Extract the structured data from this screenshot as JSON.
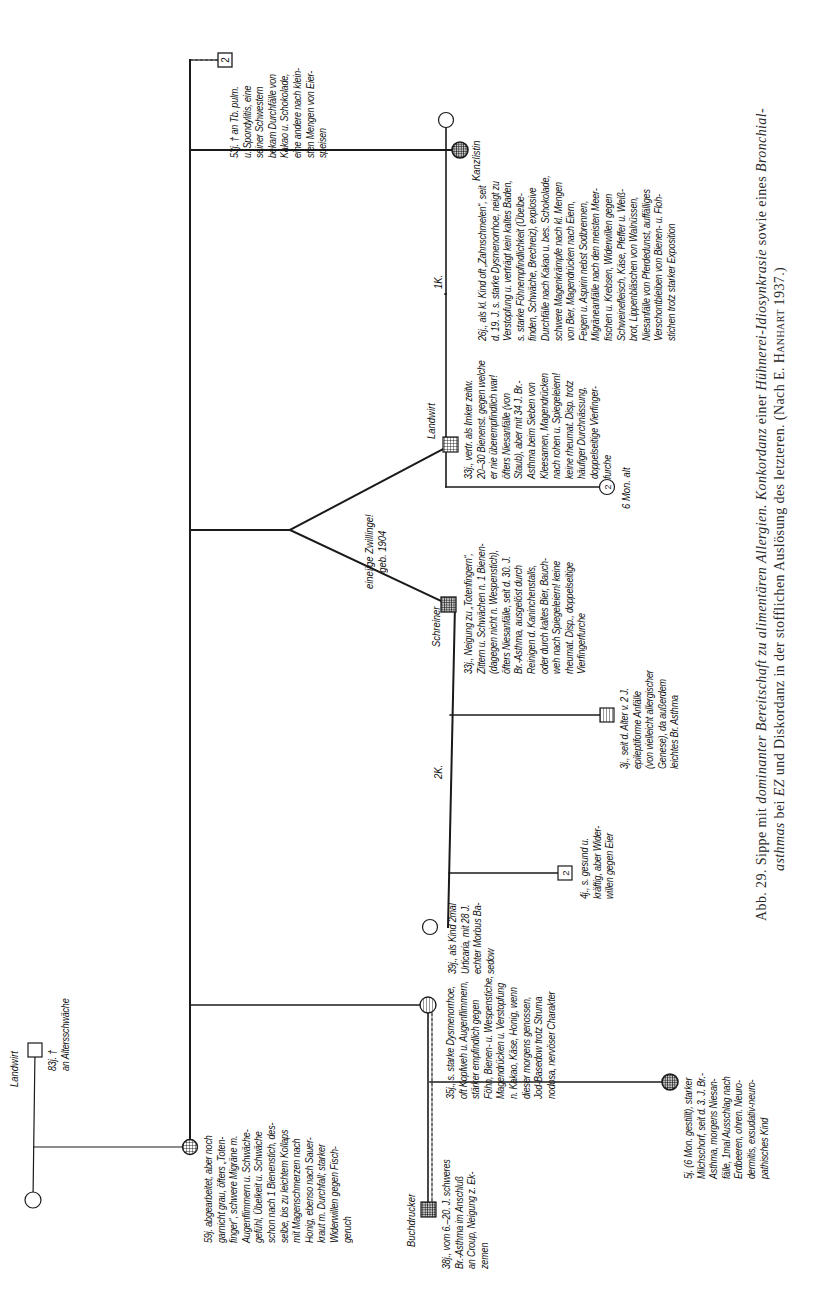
{
  "figure": {
    "caption_line1_prefix": "Abb. 29.  Sippe mit ",
    "caption_line1_italic1": "dominanter Bereitschaft zu alimentären Allergien. Konkordanz",
    "caption_line1_mid": " einer ",
    "caption_line1_italic2": "Hühnerei-Idiosynkrasie",
    "caption_line1_suffix": " sowie eines ",
    "caption_line1_italic3": "Bronchial-",
    "caption_line2_italic1": "asthmas",
    "caption_line2_mid1": " bei ",
    "caption_line2_italic2": "EZ",
    "caption_line2_suffix": " und Diskordanz in der stofflichen Auslösung des letzteren. (Nach E. ",
    "caption_line2_author": "Hanhart",
    "caption_line2_end": " 1937.)"
  },
  "legend": {
    "symbols": {
      "male": "square",
      "female": "circle",
      "affected": "cross-hatched fill",
      "partially_affected": "horizontal-hatched fill",
      "sex_unknown_count": "number in box"
    }
  },
  "persons": {
    "grandfather": {
      "occupation": "Landwirt",
      "note": "83j. †\nan Altersschwäche"
    },
    "grandmother": {},
    "mother": {
      "note": "59j. abgearbeitet, aber noch\ngarnicht grau, öfters „Toten-\nfinger“, schwere Migräne m.\nAugenflimmern u. Schwäche-\ngefühl, Übelkeit u. Schwäche\nschon nach 1 Bienenstich, des-\nselbe, bis zu leichtem Kollaps\nmit Magenschmerzen nach\nHonig, ebenso nach Sauer-\nkraut m. Durchfall; starker\nWiderwillen gegen Fisch-\ngeruch"
    },
    "siblings_box": {
      "count": "2",
      "note": "53j. † an Tb. pulm.\nu. Spondylitis, eine\nseiner Schwestern\nbekam Durchfälle von\nKakao u. Schokolade,\neine andere nach klein-\nsten Mengen von Eier-\nspeisen"
    },
    "kanzlistin": {
      "occupation": "Kanzlistin",
      "note": "26j., als kl. Kind oft „Zahnschmelen“, seit\nd. 19. J. s. starke Dysmenorrhoe, neigt zu\nVerstopfung u. verträgt kein kaltes Baden,\ns. starke Föhnempfindlichkeit (Übelbe-\nfinden, Schwäche, Brechreiz), explosive\nDurchfälle nach Kakao u. bes. Schokolade,\nschwere Magenkrämpfe nach kl. Mengen\nvon Bier, Magendrücken nach Eiern,\nFeigen u. Aspirin nebst Sodbrennen,\nMigräneanfälle nach den meisten Meer-\nfischen u. Krebsen, Widerwillen gegen\nSchweinefleisch, Käse, Pfeffer u. Weiß-\nbrot, Lippenbläschen von Walnüssen,\nNiesanfälle von Pferdedunst, auffälliges\nVerschontbleiben von Bienen- u. Floh-\nstichen trotz starker Exposition"
    },
    "twins": {
      "label": "eineiige Zwillinge!\ngeb. 1904",
      "landwirt": {
        "occupation": "Landwirt",
        "children_label": "1K.",
        "note": "33j., vertr. als Imker zeitw.\n20–30 Bienenst. gegen welche\ner nie überempfindlich war!\nöfters Niesanfälle (von\nStaub), aber mit 34 J. Br.-\nAsthma beim Sieben von\nKleesamen, Magendrücken\nnach rohen u. Spiegeleiern!\nkeine rheumat. Disp. trotz\nhäufiger Durchnässung,\ndoppelseitige Vierfinger-\nfurche"
      },
      "schreiner": {
        "occupation": "Schreiner",
        "children_label": "2K.",
        "note": "33j., Neigung zu „Totenfingern“,\nZittern u. Schwächen n. 1 Bienen-\n(dagegen nicht n. Wespenstich),\nöfters Niesanfälle, seit d. 30. J.\nBr.-Asthma, ausgelöst durch\nReinigen d. Kaninchenstalls,\noder durch kaltes Bier, Bauch-\nweh nach Spiegeleiern! keine\nrheumat. Disp., doppelseitige\nVierfingerfurche"
      }
    },
    "landwirt_child": {
      "count": "2",
      "note": "6 Mon. alt"
    },
    "schreiner_children": [
      {
        "symbol": "circle",
        "note": "39j., als Kind 2mal\nUrticaria, mit 28 J.\nechter Morbus Ba-\nsedow"
      },
      {
        "symbol": "box",
        "count": "2",
        "note": "4j., s. gesund u.\nkräftig, aber Wider-\nwillen gegen Eier"
      },
      {
        "symbol": "square",
        "note": "3j., seit d. Alter v. 2 J.\nepileptiforme Anfälle\n(von vielleicht allergischer\nGenese), da außerdem\nleichtes Br. Asthma"
      }
    ],
    "daughter_35": {
      "note": "35j., s. starke Dysmenorrhoe,\noft Kopfweh u. Augenflimmern,\nstärker empfindlich gegen\nFöhn, Bienen- u. Wespenstiche,\nMagendrücken u. Verstopfung\nn. Kakao, Käse, Honig, wenn\ndieser morgens genossen,\nJod-Basedow trotz Struma\nnodosa, nervöser Charakter"
    },
    "buchdrucker": {
      "occupation": "Buchdrucker",
      "note": "38j., vom 6.–20. J. schweres\nBr.-Asthma im Anschluß\nan Croup, Neigung z. Ek-\nzemen"
    },
    "grandchild": {
      "note": "5j. (6 Mon. gestillt), starker\nMilchschorf, seit d. 3. J. Br.-\nAsthma, morgens Niesan-\nfälle, 1mal Ausschlag nach\nErdbeeren, ohren. Neuro-\ndermitis, exsudativ-neuro-\npathisches Kind"
    }
  },
  "colors": {
    "ink": "#1a1a1a",
    "paper": "#ffffff",
    "caption": "#2a2a2a"
  }
}
